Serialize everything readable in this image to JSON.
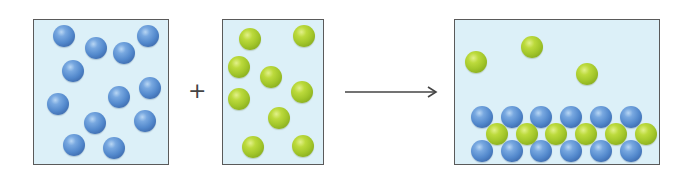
{
  "diagram": {
    "operator_plus": "+",
    "arrow": "reaction-arrow",
    "colors": {
      "box_background": "#dcf0f8",
      "box_border": "#5a5a5a",
      "blue_particle": "#5288cc",
      "green_particle": "#a2c62a",
      "arrow": "#444444"
    },
    "reactant_1": {
      "label": "blue particles",
      "count": 12,
      "box": {
        "x": 33,
        "y": 19,
        "w": 136,
        "h": 146
      },
      "particles": [
        {
          "x": 64,
          "y": 36
        },
        {
          "x": 96,
          "y": 48
        },
        {
          "x": 124,
          "y": 53
        },
        {
          "x": 148,
          "y": 36
        },
        {
          "x": 73,
          "y": 71
        },
        {
          "x": 150,
          "y": 88
        },
        {
          "x": 119,
          "y": 97
        },
        {
          "x": 58,
          "y": 104
        },
        {
          "x": 95,
          "y": 123
        },
        {
          "x": 145,
          "y": 121
        },
        {
          "x": 74,
          "y": 145
        },
        {
          "x": 114,
          "y": 148
        }
      ]
    },
    "reactant_2": {
      "label": "green particles",
      "count": 9,
      "box": {
        "x": 222,
        "y": 19,
        "w": 102,
        "h": 146
      },
      "particles": [
        {
          "x": 250,
          "y": 39
        },
        {
          "x": 304,
          "y": 36
        },
        {
          "x": 239,
          "y": 67
        },
        {
          "x": 271,
          "y": 77
        },
        {
          "x": 302,
          "y": 92
        },
        {
          "x": 239,
          "y": 99
        },
        {
          "x": 279,
          "y": 118
        },
        {
          "x": 253,
          "y": 147
        },
        {
          "x": 303,
          "y": 146
        }
      ]
    },
    "product": {
      "label": "layered solid with excess green particles",
      "box": {
        "x": 454,
        "y": 19,
        "w": 206,
        "h": 146
      },
      "free_green": [
        {
          "x": 476,
          "y": 62
        },
        {
          "x": 532,
          "y": 47
        },
        {
          "x": 587,
          "y": 74
        }
      ],
      "lattice_blue_top": [
        {
          "x": 482,
          "y": 117
        },
        {
          "x": 512,
          "y": 117
        },
        {
          "x": 541,
          "y": 117
        },
        {
          "x": 571,
          "y": 117
        },
        {
          "x": 601,
          "y": 117
        },
        {
          "x": 631,
          "y": 117
        }
      ],
      "lattice_green_mid": [
        {
          "x": 497,
          "y": 134
        },
        {
          "x": 527,
          "y": 134
        },
        {
          "x": 556,
          "y": 134
        },
        {
          "x": 586,
          "y": 134
        },
        {
          "x": 616,
          "y": 134
        },
        {
          "x": 646,
          "y": 134
        }
      ],
      "lattice_blue_bottom": [
        {
          "x": 482,
          "y": 151
        },
        {
          "x": 512,
          "y": 151
        },
        {
          "x": 541,
          "y": 151
        },
        {
          "x": 571,
          "y": 151
        },
        {
          "x": 601,
          "y": 151
        },
        {
          "x": 631,
          "y": 151
        }
      ]
    }
  }
}
